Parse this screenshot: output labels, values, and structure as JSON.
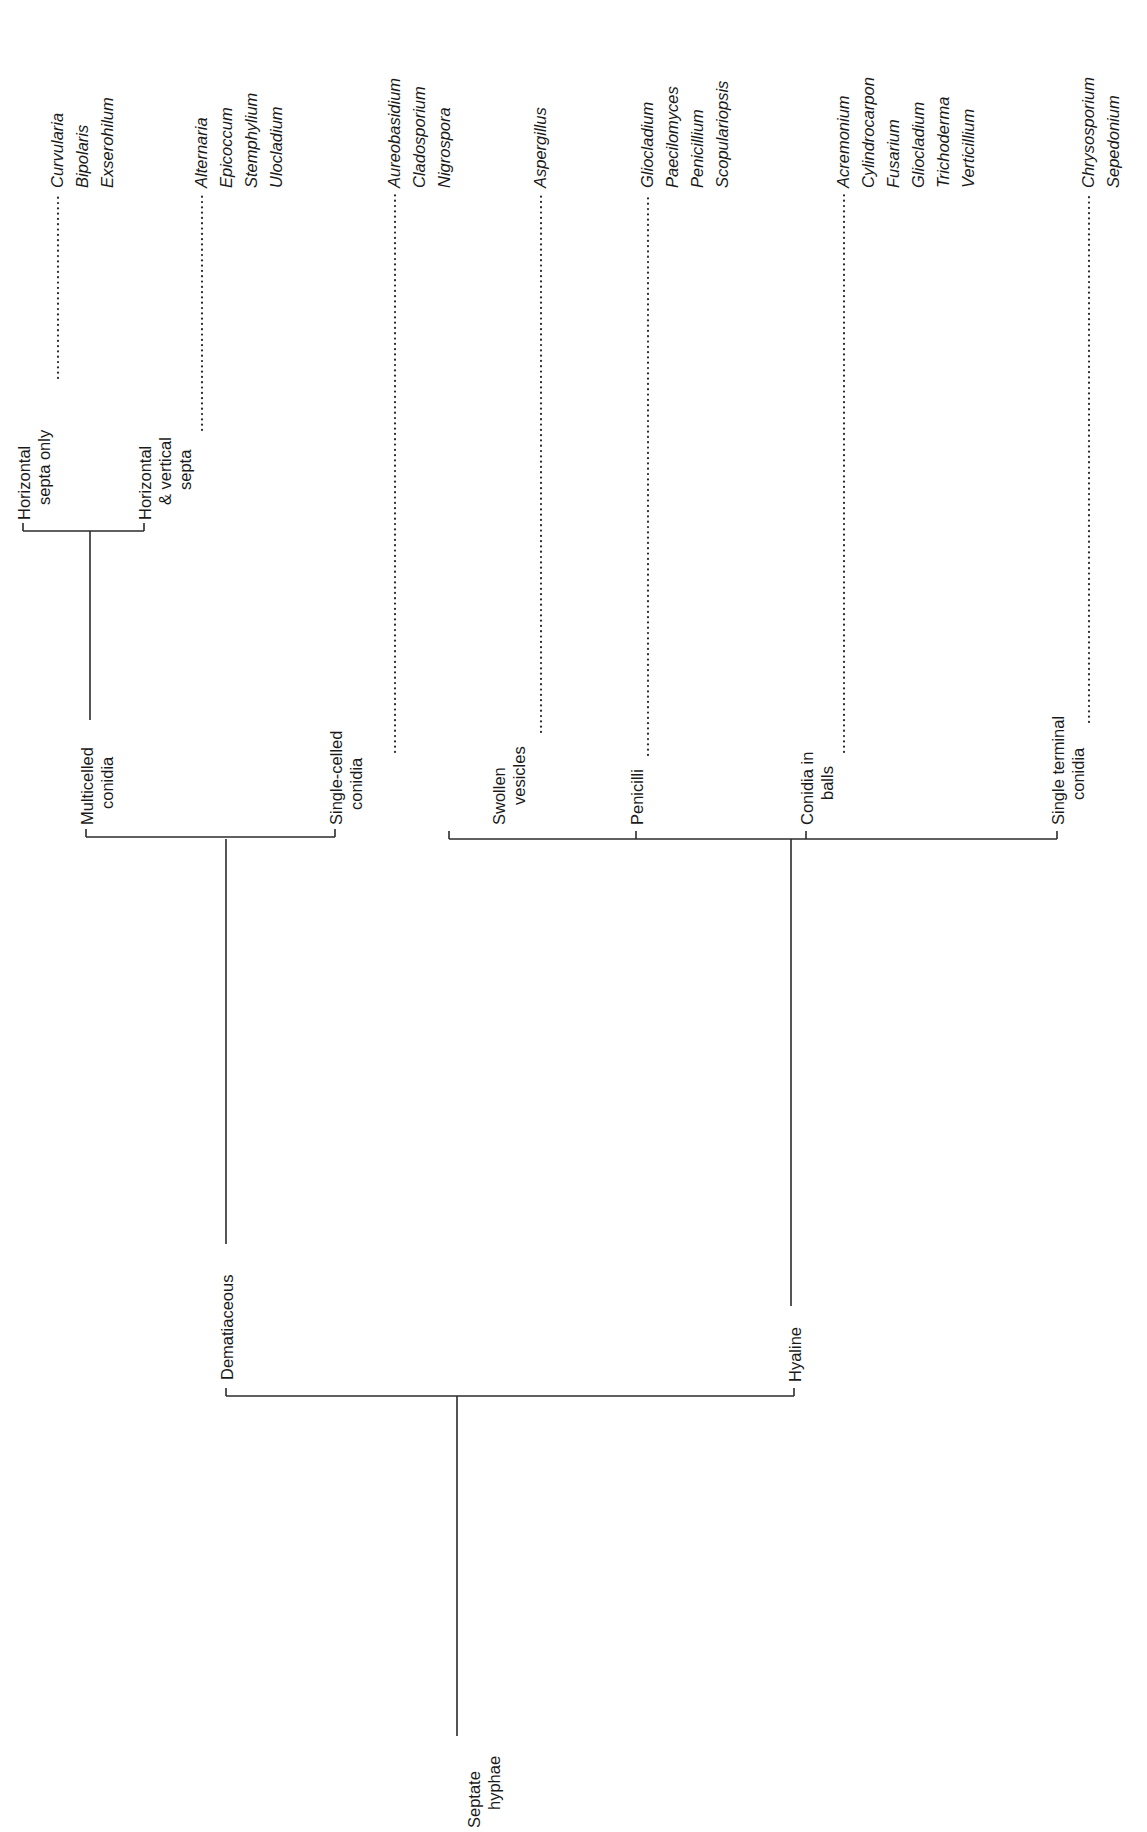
{
  "diagram": {
    "orientation": "rotated-90-ccw",
    "colors": {
      "line": "#2b2b2b",
      "text": "#1a1a1a",
      "background": "#ffffff"
    },
    "root": {
      "id": "septate-hyphae",
      "label_lines": [
        "Septate",
        "hyphae"
      ],
      "children": [
        "dematiaceous",
        "hyaline"
      ]
    },
    "nodes": {
      "dematiaceous": {
        "label_lines": [
          "Dematiaceous"
        ],
        "children": [
          "multicelled-conidia",
          "single-celled-conidia"
        ]
      },
      "hyaline": {
        "label_lines": [
          "Hyaline"
        ],
        "children": [
          "swollen-vesicles",
          "penicilli",
          "conidia-in-balls",
          "single-terminal-conidia"
        ]
      },
      "multicelled-conidia": {
        "label_lines": [
          "Multicelled",
          "conidia"
        ],
        "children": [
          "horizontal-septa-only",
          "horizontal-vertical-septa"
        ]
      },
      "single-celled-conidia": {
        "label_lines": [
          "Single-celled",
          "conidia"
        ],
        "genera": [
          "Aureobasidium",
          "Cladosporium",
          "Nigrospora"
        ]
      },
      "horizontal-septa-only": {
        "label_lines": [
          "Horizontal",
          "septa only"
        ],
        "genera": [
          "Curvularia",
          "Bipolaris",
          "Exserohilum"
        ]
      },
      "horizontal-vertical-septa": {
        "label_lines": [
          "Horizontal",
          "& vertical",
          "septa"
        ],
        "genera": [
          "Alternaria",
          "Epicoccum",
          "Stemphylium",
          "Ulocladium"
        ]
      },
      "swollen-vesicles": {
        "label_lines": [
          "Swollen",
          "vesicles"
        ],
        "genera": [
          "Aspergillus"
        ]
      },
      "penicilli": {
        "label_lines": [
          "Penicilli"
        ],
        "genera": [
          "Gliocladium",
          "Paecilomyces",
          "Penicillium",
          "Scopulariopsis"
        ]
      },
      "conidia-in-balls": {
        "label_lines": [
          "Conidia in",
          "balls"
        ],
        "genera": [
          "Acremonium",
          "Cylindrocarpon",
          "Fusarium",
          "Gliocladium",
          "Trichoderma",
          "Verticillium"
        ]
      },
      "single-terminal-conidia": {
        "label_lines": [
          "Single terminal",
          "conidia"
        ],
        "genera": [
          "Chrysosporium",
          "Sepedonium"
        ]
      }
    }
  },
  "labels": {
    "root": [
      "Septate",
      "hyphae"
    ],
    "dematiaceous": "Dematiaceous",
    "hyaline": "Hyaline",
    "multicelled": [
      "Multicelled",
      "conidia"
    ],
    "single_celled": [
      "Single-celled",
      "conidia"
    ],
    "horizontal_only": [
      "Horizontal",
      "septa only"
    ],
    "horizontal_vertical": [
      "Horizontal",
      "& vertical",
      "septa"
    ],
    "swollen": [
      "Swollen",
      "vesicles"
    ],
    "penicilli": "Penicilli",
    "conidia_balls": [
      "Conidia in",
      "balls"
    ],
    "single_terminal": [
      "Single terminal",
      "conidia"
    ],
    "genera": {
      "horizontal_only": [
        "Curvularia",
        "Bipolaris",
        "Exserohilum"
      ],
      "horizontal_vertical": [
        "Alternaria",
        "Epicoccum",
        "Stemphylium",
        "Ulocladium"
      ],
      "single_celled": [
        "Aureobasidium",
        "Cladosporium",
        "Nigrospora"
      ],
      "swollen": [
        "Aspergillus"
      ],
      "penicilli": [
        "Gliocladium",
        "Paecilomyces",
        "Penicillium",
        "Scopulariopsis"
      ],
      "conidia_balls": [
        "Acremonium",
        "Cylindrocarpon",
        "Fusarium",
        "Gliocladium",
        "Trichoderma",
        "Verticillium"
      ],
      "single_terminal": [
        "Chrysosporium",
        "Sepedonium"
      ]
    }
  }
}
